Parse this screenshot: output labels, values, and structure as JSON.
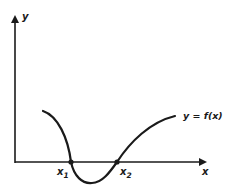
{
  "diagram": {
    "axes": {
      "x_label": "x",
      "y_label": "y"
    },
    "curve_label": "y = f(x)",
    "roots": [
      {
        "label": "x",
        "subscript": "1"
      },
      {
        "label": "x",
        "subscript": "2"
      }
    ],
    "colors": {
      "ink": "#1a1a1a",
      "background": "#ffffff"
    }
  }
}
